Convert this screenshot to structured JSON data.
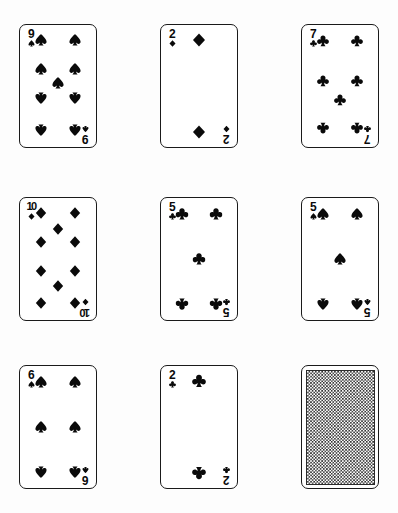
{
  "scene": {
    "title": "Playing card grid",
    "background_color": "#fdfdfd",
    "ink_color": "#0a0a0a",
    "columns": 3,
    "rows": 3,
    "card_width": 78,
    "card_height": 124,
    "deck_style": "monochrome",
    "note": "All suits rendered in black ink"
  },
  "cards": [
    {
      "id": "card-1",
      "position": "row-1-col-1",
      "rank": "9",
      "rank_display": "9",
      "suit": "spades",
      "suit_symbol": "♠",
      "face_up": true,
      "pip_count": 9,
      "x": 19,
      "y": 24
    },
    {
      "id": "card-2",
      "position": "row-1-col-2",
      "rank": "2",
      "rank_display": "2",
      "suit": "diamonds",
      "suit_symbol": "♦",
      "face_up": true,
      "pip_count": 2,
      "x": 160,
      "y": 24
    },
    {
      "id": "card-3",
      "position": "row-1-col-3",
      "rank": "7",
      "rank_display": "7",
      "suit": "clubs",
      "suit_symbol": "♣",
      "face_up": true,
      "pip_count": 7,
      "x": 301,
      "y": 24
    },
    {
      "id": "card-4",
      "position": "row-2-col-1",
      "rank": "10",
      "rank_display": "10",
      "suit": "diamonds",
      "suit_symbol": "♦",
      "face_up": true,
      "pip_count": 10,
      "x": 19,
      "y": 197
    },
    {
      "id": "card-5",
      "position": "row-2-col-2",
      "rank": "5",
      "rank_display": "5",
      "suit": "clubs",
      "suit_symbol": "♣",
      "face_up": true,
      "pip_count": 5,
      "x": 160,
      "y": 197
    },
    {
      "id": "card-6",
      "position": "row-2-col-3",
      "rank": "5",
      "rank_display": "5",
      "suit": "spades",
      "suit_symbol": "♠",
      "face_up": true,
      "pip_count": 5,
      "x": 301,
      "y": 197
    },
    {
      "id": "card-7",
      "position": "row-3-col-1",
      "rank": "6",
      "rank_display": "6",
      "suit": "spades",
      "suit_symbol": "♠",
      "face_up": true,
      "pip_count": 6,
      "x": 19,
      "y": 365
    },
    {
      "id": "card-8",
      "position": "row-3-col-2",
      "rank": "2",
      "rank_display": "2",
      "suit": "clubs",
      "suit_symbol": "♣",
      "face_up": true,
      "pip_count": 2,
      "x": 160,
      "y": 365
    },
    {
      "id": "card-9",
      "position": "row-3-col-3",
      "rank": "",
      "rank_display": "",
      "suit": "back",
      "suit_symbol": "",
      "face_up": false,
      "pip_count": 0,
      "x": 301,
      "y": 365,
      "back_pattern": "checkerboard"
    }
  ]
}
